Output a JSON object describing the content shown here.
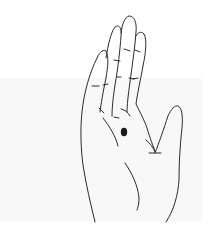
{
  "image": {
    "subject": "hand-palm-illustration",
    "alt": "Line drawing of an open right-hand palm with fingers together and thumb extended, with a dark dot marked on the palm below the ring and middle fingers",
    "colors": {
      "background": "#ffffff",
      "band": "#f8f8f8",
      "line": "#2a2a2a",
      "dot": "#1a1a1a"
    },
    "marker": {
      "label": "palm-dot",
      "cx": 124,
      "cy": 132
    }
  }
}
